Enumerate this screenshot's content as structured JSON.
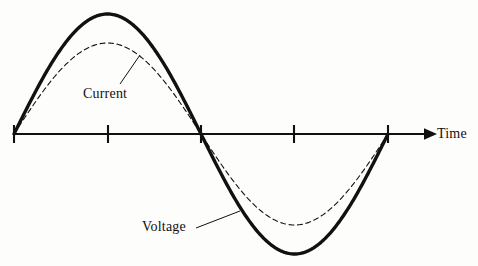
{
  "figure": {
    "type": "waveform-diagram",
    "title": "",
    "background_color": "#fdfdfc",
    "ink_color": "#111111",
    "width": 478,
    "height": 266
  },
  "axis": {
    "name": "time-axis",
    "label": "Time",
    "orientation": "horizontal",
    "baseline_y": 134,
    "start_x": 14,
    "end_x": 430,
    "arrow_head": "right",
    "tick_positions_px": [
      14,
      108,
      201,
      294,
      388
    ],
    "tick_half_height_px": 9,
    "tick_count": 5
  },
  "curves": [
    {
      "name": "voltage-curve",
      "label": "Voltage",
      "style": "solid",
      "stroke_width": 3.4,
      "color": "#111111",
      "amplitude_px": 120,
      "phase_deg": 0,
      "peak_value_px": 14,
      "trough_value_px": 254,
      "peak_x_px": 108,
      "trough_x_px": 294
    },
    {
      "name": "current-curve",
      "label": "Current",
      "style": "dashed",
      "dash_pattern": "5,3.5",
      "stroke_width": 1.1,
      "color": "#111111",
      "amplitude_px": 91,
      "phase_deg": 0,
      "peak_value_px": 43,
      "trough_value_px": 225,
      "peak_x_px": 108,
      "trough_x_px": 294
    }
  ],
  "annotations": [
    {
      "name": "current-annotation",
      "text": "Current",
      "label_x": 83,
      "label_y": 86,
      "leader_from": [
        120,
        84
      ],
      "leader_to": [
        140,
        55
      ]
    },
    {
      "name": "voltage-annotation",
      "text": "Voltage",
      "label_x": 142,
      "label_y": 219,
      "leader_from": [
        196,
        228
      ],
      "leader_to": [
        240,
        211
      ]
    }
  ],
  "chart_data": {
    "type": "line",
    "title": "",
    "xlabel": "Time",
    "ylabel": "",
    "grid": false,
    "legend": "inline-annotations",
    "x": [
      0,
      0.25,
      0.5,
      0.75,
      1.0
    ],
    "xtick_labels": [
      "",
      "",
      "",
      "",
      ""
    ],
    "series": [
      {
        "name": "Voltage",
        "style": "solid",
        "amplitude": 1.0,
        "values": [
          0,
          1.0,
          0,
          -1.0,
          0
        ]
      },
      {
        "name": "Current",
        "style": "dashed",
        "amplitude": 0.76,
        "values": [
          0,
          0.76,
          0,
          -0.76,
          0
        ]
      }
    ],
    "ylim": [
      -1.1,
      1.1
    ],
    "xlim": [
      0,
      1.12
    ]
  }
}
